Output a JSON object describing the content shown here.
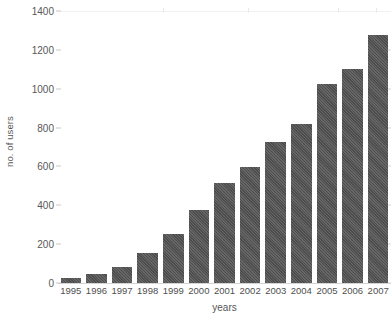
{
  "chart_data": {
    "type": "bar",
    "title": "",
    "xlabel": "years",
    "ylabel": "no. of users",
    "categories": [
      "1995",
      "1996",
      "1997",
      "1998",
      "1999",
      "2000",
      "2001",
      "2002",
      "2003",
      "2004",
      "2005",
      "2006",
      "2007"
    ],
    "values": [
      25,
      45,
      85,
      155,
      250,
      375,
      515,
      595,
      725,
      820,
      1025,
      1100,
      1275
    ],
    "ylim": [
      0,
      1400
    ],
    "yticks": [
      0,
      200,
      400,
      600,
      800,
      1000,
      1200,
      1400
    ],
    "ytick_labels": [
      "0",
      "200",
      "400",
      "600",
      "800",
      "1000",
      "1200",
      "1400"
    ],
    "grid": false,
    "legend": null,
    "bar_color": "#4d4d4d",
    "background_color": "#ffffff",
    "axis_text_color": "#555555"
  }
}
